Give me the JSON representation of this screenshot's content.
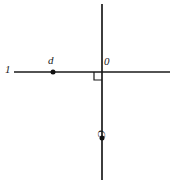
{
  "figure": {
    "type": "geometry-diagram",
    "background_color": "#ffffff",
    "stroke_color": "#1a1a1a",
    "canvas": {
      "width": 179,
      "height": 185
    },
    "lines": [
      {
        "id": "horizontal-line",
        "name": "horizontal-line",
        "label": "1",
        "x1": 14,
        "y1": 72,
        "x2": 170,
        "y2": 72,
        "stroke_width": 1.6
      },
      {
        "id": "vertical-line",
        "name": "vertical-line",
        "label": "",
        "x1": 102,
        "y1": 4,
        "x2": 102,
        "y2": 180,
        "stroke_width": 1.6
      }
    ],
    "right_angle_marker": {
      "name": "right-angle-marker",
      "x": 94,
      "y": 72,
      "size": 8
    },
    "points": [
      {
        "id": "d",
        "name": "point-d",
        "label": "d",
        "x": 53,
        "y": 72,
        "radius": 2.4
      },
      {
        "id": "c",
        "name": "point-c",
        "label": "C",
        "x": 102,
        "y": 138,
        "radius": 2.4
      }
    ],
    "labels": {
      "line_l": "1",
      "point_d": "d",
      "origin": "0",
      "point_c": "C"
    }
  }
}
